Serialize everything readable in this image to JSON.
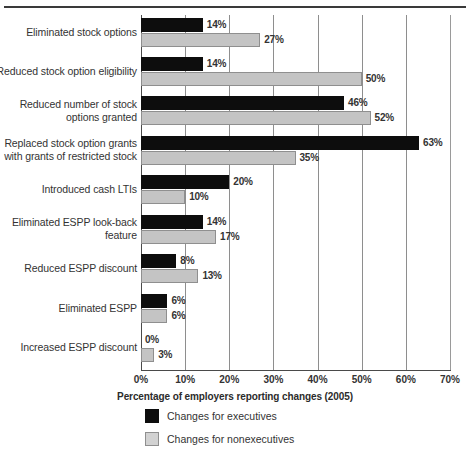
{
  "chart_data": {
    "type": "bar",
    "orientation": "horizontal",
    "title": "",
    "xlabel": "Percentage of employers reporting changes (2005)",
    "ylabel": "",
    "xlim": [
      0,
      70
    ],
    "xticks": [
      "0%",
      "10%",
      "20%",
      "30%",
      "40%",
      "50%",
      "60%",
      "70%"
    ],
    "xtick_values": [
      0,
      10,
      20,
      30,
      40,
      50,
      60,
      70
    ],
    "grid": true,
    "legend_position": "bottom-left",
    "categories": [
      "Eliminated stock options",
      "Reduced stock option eligibility",
      "Reduced number of stock\noptions granted",
      "Replaced stock option grants\nwith grants of restricted stock",
      "Introduced cash LTIs",
      "Eliminated ESPP look-back\nfeature",
      "Reduced ESPP discount",
      "Eliminated ESPP",
      "Increased ESPP discount"
    ],
    "series": [
      {
        "name": "Changes for executives",
        "color": "#0d0d0d",
        "values": [
          14,
          14,
          46,
          63,
          20,
          14,
          8,
          6,
          0
        ],
        "labels": [
          "14%",
          "14%",
          "46%",
          "63%",
          "20%",
          "14%",
          "8%",
          "6%",
          "0%"
        ]
      },
      {
        "name": "Changes for nonexecutives",
        "color": "#c4c4c4",
        "values": [
          27,
          50,
          52,
          35,
          10,
          17,
          13,
          6,
          3
        ],
        "labels": [
          "27%",
          "50%",
          "52%",
          "35%",
          "10%",
          "17%",
          "13%",
          "6%",
          "3%"
        ]
      }
    ]
  },
  "legend": {
    "items": [
      {
        "label": "Changes for executives",
        "swatch": "exec"
      },
      {
        "label": "Changes for nonexecutives",
        "swatch": "nonexec"
      }
    ]
  },
  "colors": {
    "executives": "#0d0d0d",
    "nonexecutives": "#c4c4c4",
    "axis": "#4a4a4a",
    "grid": "#8e8e8e",
    "text": "#333333"
  }
}
